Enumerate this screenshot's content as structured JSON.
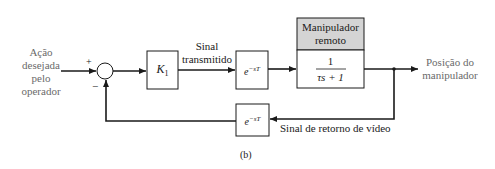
{
  "diagram": {
    "figure_label": "(b)",
    "input": {
      "label_lines": [
        "Ação",
        "desejada",
        "pelo",
        "operador"
      ]
    },
    "summing_junction": {
      "plus_sign": "+",
      "minus_sign": "−"
    },
    "blocks": {
      "gain": {
        "symbol": "K",
        "subscript": "1"
      },
      "forward_delay": {
        "base": "e",
        "exponent": "−sT"
      },
      "manipulator": {
        "header_lines": [
          "Manipulador",
          "remoto"
        ],
        "numerator": "1",
        "denominator": "τs + 1"
      },
      "feedback_delay": {
        "base": "e",
        "exponent": "−sT"
      }
    },
    "signals": {
      "transmitted_lines": [
        "Sinal",
        "transmitido"
      ],
      "video_return": "Sinal de retorno de vídeo"
    },
    "output": {
      "label_lines": [
        "Posição do",
        "manipulador"
      ]
    },
    "colors": {
      "line": "#1a1a1a",
      "header_fill": "#d4d4d4",
      "muted_text": "#6a6a6a"
    }
  }
}
